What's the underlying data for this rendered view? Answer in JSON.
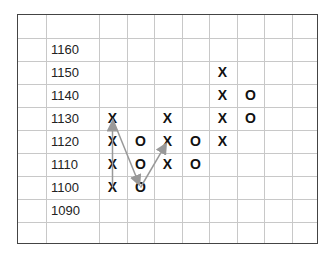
{
  "chart_data": {
    "type": "point-and-figure",
    "title": "",
    "xlabel": "",
    "ylabel": "",
    "box_size": 10,
    "price_labels": [
      1160,
      1150,
      1140,
      1130,
      1120,
      1110,
      1100,
      1090
    ],
    "columns": [
      {
        "index": 1,
        "type": "X",
        "prices": [
          1100,
          1110,
          1120,
          1130
        ]
      },
      {
        "index": 2,
        "type": "O",
        "prices": [
          1120,
          1110,
          1100
        ]
      },
      {
        "index": 3,
        "type": "X",
        "prices": [
          1110,
          1120,
          1130
        ]
      },
      {
        "index": 4,
        "type": "O",
        "prices": [
          1120,
          1110
        ]
      },
      {
        "index": 5,
        "type": "X",
        "prices": [
          1120,
          1130,
          1140,
          1150
        ]
      },
      {
        "index": 6,
        "type": "O",
        "prices": [
          1140,
          1130
        ]
      }
    ],
    "arrows": [
      {
        "from": {
          "col": 1,
          "price": 1100
        },
        "to": {
          "col": 1,
          "price": 1130
        }
      },
      {
        "from": {
          "col": 1,
          "price": 1130
        },
        "to": {
          "col": 2,
          "price": 1100
        }
      },
      {
        "from": {
          "col": 2,
          "price": 1100
        },
        "to": {
          "col": 3,
          "price": 1120
        }
      }
    ],
    "grid": true,
    "colors": {
      "grid": "#c8c8c8",
      "border": "#444444",
      "arrow": "#999999",
      "marker": "#111111"
    }
  }
}
